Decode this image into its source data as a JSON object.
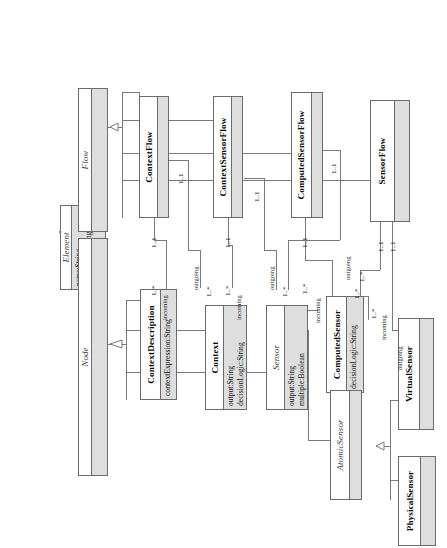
{
  "diagram": {
    "kind": "uml-class-diagram",
    "orientation": "rotated-90-ccw",
    "background": "#ffffff",
    "line_color": "#6b6b6b",
    "attribute_band_color": "#dedede"
  },
  "classes": [
    {
      "id": "element",
      "name": "Element",
      "abstract": true,
      "attributes": [
        "name:String",
        "description:String"
      ]
    },
    {
      "id": "flow",
      "name": "Flow",
      "abstract": true,
      "attributes": []
    },
    {
      "id": "node",
      "name": "Node",
      "abstract": true,
      "attributes": []
    },
    {
      "id": "context-flow",
      "name": "ContextFlow",
      "abstract": false,
      "attributes": []
    },
    {
      "id": "context-sensor-flow",
      "name": "ContextSensorFlow",
      "abstract": false,
      "attributes": []
    },
    {
      "id": "computed-sensor-flow",
      "name": "ComputedSensorFlow",
      "abstract": false,
      "attributes": []
    },
    {
      "id": "sensor-flow",
      "name": "SensorFlow",
      "abstract": false,
      "attributes": []
    },
    {
      "id": "context-description",
      "name": "ContextDescription",
      "abstract": false,
      "attributes": [
        "contextExpression:String"
      ]
    },
    {
      "id": "context",
      "name": "Context",
      "abstract": false,
      "attributes": [
        "output:String",
        "decisionLogic:String"
      ]
    },
    {
      "id": "sensor",
      "name": "Sensor",
      "abstract": true,
      "attributes": [
        "output:String",
        "multiple:Boolean"
      ]
    },
    {
      "id": "computed-sensor",
      "name": "ComputedSensor",
      "abstract": false,
      "attributes": [
        "decisionLogic:String"
      ]
    },
    {
      "id": "atomic-sensor",
      "name": "AtomicSensor",
      "abstract": true,
      "attributes": []
    },
    {
      "id": "virtual-sensor",
      "name": "VirtualSensor",
      "abstract": false,
      "attributes": []
    },
    {
      "id": "physical-sensor",
      "name": "PhysicalSensor",
      "abstract": false,
      "attributes": []
    }
  ],
  "edge_labels": {
    "incoming": "incoming",
    "outgoing": "outgoing",
    "one_to_one": "1..1",
    "one_to_many": "1..*"
  },
  "labels": [
    {
      "id": "l01",
      "text": "1..1"
    },
    {
      "id": "l02",
      "text": "1..*"
    },
    {
      "id": "l03",
      "text": "incoming"
    },
    {
      "id": "l04",
      "text": "1..1"
    },
    {
      "id": "l05",
      "text": "outgoing"
    },
    {
      "id": "l06",
      "text": "1..*"
    },
    {
      "id": "l07",
      "text": "1..1"
    },
    {
      "id": "l08",
      "text": "1..*"
    },
    {
      "id": "l09",
      "text": "incoming"
    },
    {
      "id": "l10",
      "text": "1..1"
    },
    {
      "id": "l11",
      "text": "outgoing"
    },
    {
      "id": "l12",
      "text": "1..*"
    },
    {
      "id": "l13",
      "text": "1..1"
    },
    {
      "id": "l14",
      "text": "1..*"
    },
    {
      "id": "l15",
      "text": "incoming"
    },
    {
      "id": "l16",
      "text": "1..1"
    },
    {
      "id": "l17",
      "text": "outgoing"
    },
    {
      "id": "l18",
      "text": "1..*"
    },
    {
      "id": "l19",
      "text": "1..1"
    },
    {
      "id": "l20",
      "text": "1..1"
    },
    {
      "id": "l21",
      "text": "incoming"
    },
    {
      "id": "l22",
      "text": "1..*"
    },
    {
      "id": "l23",
      "text": "outgoing"
    },
    {
      "id": "l24",
      "text": "1..*"
    }
  ]
}
